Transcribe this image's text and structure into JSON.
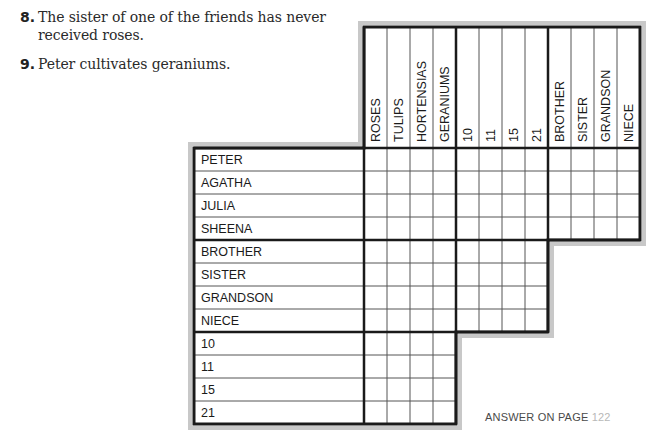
{
  "clues": [
    {
      "number": "8.",
      "text": "The sister of one of the friends has never received roses."
    },
    {
      "number": "9.",
      "text": "Peter cultivates geraniums."
    }
  ],
  "grid": {
    "column_groups": [
      {
        "name": "flowers",
        "labels": [
          "ROSES",
          "TULIPS",
          "HORTENSIAS",
          "GERANIUMS"
        ]
      },
      {
        "name": "numbers",
        "labels": [
          "10",
          "11",
          "15",
          "21"
        ]
      },
      {
        "name": "relatives",
        "labels": [
          "BROTHER",
          "SISTER",
          "GRANDSON",
          "NIECE"
        ]
      }
    ],
    "row_groups": [
      {
        "name": "friends",
        "labels": [
          "PETER",
          "AGATHA",
          "JULIA",
          "SHEENA"
        ]
      },
      {
        "name": "relatives",
        "labels": [
          "BROTHER",
          "SISTER",
          "GRANDSON",
          "NIECE"
        ]
      },
      {
        "name": "numbers",
        "labels": [
          "10",
          "11",
          "15",
          "21"
        ]
      }
    ],
    "colors": {
      "line": "#1a1a1a",
      "halo": "#c8c8c8"
    }
  },
  "footer": {
    "answer_label": "ANSWER ON PAGE",
    "page": "122"
  }
}
